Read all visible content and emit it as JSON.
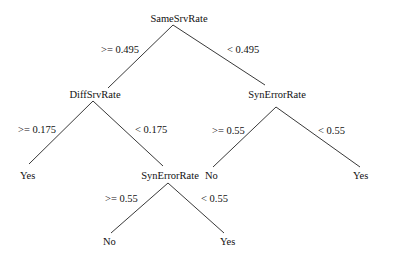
{
  "tree": {
    "root": {
      "label": "SameSrvRate"
    },
    "edges": {
      "root_left": ">= 0.495",
      "root_right": "< 0.495",
      "diff_left": ">= 0.175",
      "diff_right": "< 0.175",
      "syn1_left": ">= 0.55",
      "syn1_right": "< 0.55",
      "syn2_left": ">= 0.55",
      "syn2_right": "< 0.55"
    },
    "nodes": {
      "diff": "DiffSrvRate",
      "syn_right": "SynErrorRate",
      "syn_bottom": "SynErrorRate"
    },
    "leaves": {
      "diff_yes": "Yes",
      "synr_no": "No",
      "synr_yes": "Yes",
      "synb_no": "No",
      "synb_yes": "Yes"
    }
  }
}
